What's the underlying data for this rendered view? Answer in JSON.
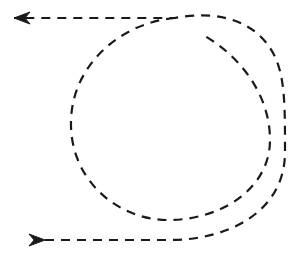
{
  "figure": {
    "title": "Dashed spiral loop path with directional arrowheads",
    "background_color": "#ffffff",
    "stroke_color": "#1a1a1a",
    "width": 293,
    "height": 259
  },
  "style": {
    "stroke_width": 2.2,
    "dash_length": 9,
    "dash_gap": 7,
    "dash_array": "9 7",
    "line_cap": "butt"
  },
  "paths": [
    {
      "id": "spiral-path",
      "name": "dashed-spiral-path",
      "description": "Single continuous dashed curve: enters from lower-left horizontal segment, sweeps clockwise around an outer loop, spirals inward to a tighter inner loop, and exits along the upper-left horizontal segment.",
      "d": "M 45 240 L 170 240 C 228 240 285 212 285 152 C 285 92 285 62 262 38 C 236 11 196 14 175 18 L 14 18",
      "direction": "clockwise-inward",
      "turns": 1.5
    },
    {
      "id": "inner-arc-path",
      "name": "dashed-inner-arc-path",
      "description": "Inner turn of the spiral, a near-circular dashed arc offset inward from the outer loop.",
      "d": "M 175 18 C 124 22 73 62 71 120 C 69 180 118 220 168 220 C 222 220 270 188 270 140 C 270 96 242 58 205 36",
      "direction": "clockwise-inward",
      "turns": 1.0
    }
  ],
  "arrows": [
    {
      "id": "arrow-top-left",
      "name": "arrowhead-left",
      "label": "end arrowhead pointing left",
      "direction": "left",
      "tip_x": 14,
      "tip_y": 18,
      "length": 16,
      "half_width": 6
    },
    {
      "id": "arrow-bottom-left",
      "name": "arrowhead-right",
      "label": "start arrowhead pointing right",
      "direction": "right",
      "tip_x": 45,
      "tip_y": 240,
      "length": 16,
      "half_width": 6
    }
  ],
  "chart_data": {
    "type": "line",
    "title": "Dashed spiral loop path with directional arrowheads",
    "xlabel": "",
    "ylabel": "",
    "xlim": [
      0,
      293
    ],
    "ylim": [
      0,
      259
    ],
    "grid": false,
    "legend": "none",
    "series": [
      {
        "name": "outer-spiral-turn",
        "style": "dashed",
        "color": "#1a1a1a",
        "points": [
          [
            45,
            240
          ],
          [
            80,
            240
          ],
          [
            120,
            240
          ],
          [
            170,
            240
          ],
          [
            205,
            238
          ],
          [
            240,
            226
          ],
          [
            266,
            205
          ],
          [
            280,
            180
          ],
          [
            285,
            152
          ],
          [
            285,
            125
          ],
          [
            285,
            100
          ],
          [
            280,
            75
          ],
          [
            270,
            54
          ],
          [
            252,
            36
          ],
          [
            230,
            22
          ],
          [
            205,
            17
          ],
          [
            180,
            18
          ],
          [
            150,
            18
          ],
          [
            110,
            18
          ],
          [
            70,
            18
          ],
          [
            14,
            18
          ]
        ]
      },
      {
        "name": "inner-spiral-turn",
        "style": "dashed",
        "color": "#1a1a1a",
        "points": [
          [
            175,
            18
          ],
          [
            150,
            22
          ],
          [
            122,
            33
          ],
          [
            100,
            50
          ],
          [
            83,
            72
          ],
          [
            73,
            96
          ],
          [
            71,
            120
          ],
          [
            74,
            148
          ],
          [
            86,
            175
          ],
          [
            106,
            197
          ],
          [
            134,
            213
          ],
          [
            168,
            220
          ],
          [
            200,
            216
          ],
          [
            230,
            202
          ],
          [
            254,
            180
          ],
          [
            267,
            157
          ],
          [
            270,
            140
          ],
          [
            268,
            118
          ],
          [
            258,
            92
          ],
          [
            240,
            68
          ],
          [
            222,
            50
          ],
          [
            205,
            36
          ]
        ]
      }
    ],
    "annotations": [
      {
        "text": "arrowhead pointing left",
        "x": 14,
        "y": 18
      },
      {
        "text": "arrowhead pointing right",
        "x": 45,
        "y": 240
      }
    ]
  }
}
